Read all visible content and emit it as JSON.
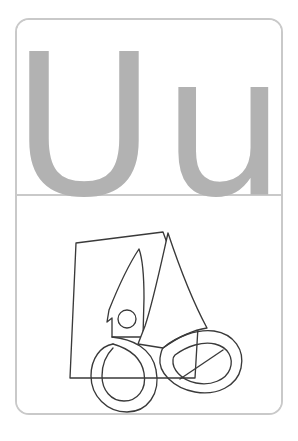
{
  "card": {
    "type": "alphabet-flashcard",
    "border_color": "#c9c9c9",
    "background_color": "#ffffff"
  },
  "letter_panel": {
    "uppercase": "U",
    "lowercase": "u",
    "letter_color": "#b2b2b2"
  },
  "picture_panel": {
    "illustration_name": "scissors-and-paper",
    "ink_color": "#3a3a3a",
    "fill_color": "#ffffff",
    "parts": [
      "sheet-of-paper",
      "scissors-upper-blade",
      "scissors-lower-blade",
      "pivot-screw",
      "left-handle-loop",
      "right-handle-loop"
    ]
  }
}
